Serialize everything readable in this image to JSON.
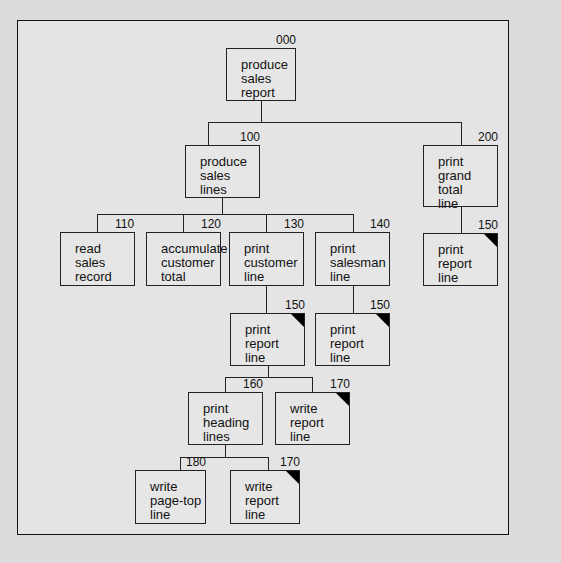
{
  "diagram": {
    "type": "structure chart",
    "nodes": [
      {
        "id": "000",
        "label": "produce\nsales\nreport",
        "x": 226,
        "y": 48,
        "w": 70,
        "h": 53,
        "shared": false
      },
      {
        "id": "100",
        "label": "produce\nsales\nlines",
        "x": 185,
        "y": 145,
        "w": 75,
        "h": 53,
        "shared": false
      },
      {
        "id": "200",
        "label": "print\ngrand\ntotal\nline",
        "x": 423,
        "y": 145,
        "w": 75,
        "h": 62,
        "shared": false
      },
      {
        "id": "110",
        "label": "read\nsales\nrecord",
        "x": 60,
        "y": 232,
        "w": 75,
        "h": 54,
        "shared": false
      },
      {
        "id": "120",
        "label": "accumulate\ncustomer\ntotal",
        "x": 146,
        "y": 232,
        "w": 75,
        "h": 54,
        "shared": false
      },
      {
        "id": "130",
        "label": "print\ncustomer\nline",
        "x": 229,
        "y": 232,
        "w": 75,
        "h": 54,
        "shared": false
      },
      {
        "id": "140",
        "label": "print\nsalesman\nline",
        "x": 315,
        "y": 232,
        "w": 75,
        "h": 54,
        "shared": false
      },
      {
        "id": "150",
        "label": "print\nreport\nline",
        "x": 423,
        "y": 233,
        "w": 75,
        "h": 53,
        "shared": true
      },
      {
        "id": "150",
        "label": "print\nreport\nline",
        "x": 230,
        "y": 313,
        "w": 75,
        "h": 53,
        "shared": true
      },
      {
        "id": "150",
        "label": "print\nreport\nline",
        "x": 315,
        "y": 313,
        "w": 75,
        "h": 53,
        "shared": true
      },
      {
        "id": "160",
        "label": "print\nheading\nlines",
        "x": 188,
        "y": 392,
        "w": 75,
        "h": 53,
        "shared": false
      },
      {
        "id": "170",
        "label": "write\nreport\nline",
        "x": 275,
        "y": 392,
        "w": 75,
        "h": 53,
        "shared": true
      },
      {
        "id": "180",
        "label": "write\npage-top\nline",
        "x": 135,
        "y": 470,
        "w": 71,
        "h": 54,
        "shared": false
      },
      {
        "id": "170",
        "label": "write\nreport\nline",
        "x": 230,
        "y": 470,
        "w": 70,
        "h": 54,
        "shared": true
      }
    ]
  }
}
